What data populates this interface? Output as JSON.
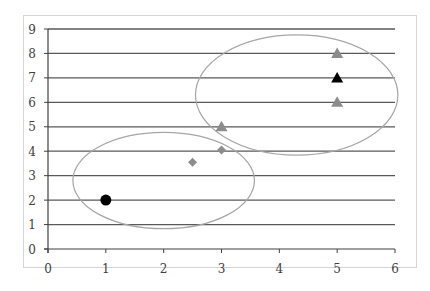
{
  "chart_data": {
    "type": "scatter",
    "title": "",
    "xlabel": "",
    "ylabel": "",
    "xlim": [
      0,
      6
    ],
    "ylim": [
      0,
      9
    ],
    "x_ticks": [
      "0",
      "1",
      "2",
      "3",
      "4",
      "5",
      "6"
    ],
    "y_ticks": [
      "0",
      "1",
      "2",
      "3",
      "4",
      "5",
      "6",
      "7",
      "8",
      "9"
    ],
    "grid": "horizontal",
    "legend": "none",
    "series": [
      {
        "name": "black-circle",
        "marker": "circle",
        "color": "#000000",
        "points": [
          [
            1,
            2
          ]
        ]
      },
      {
        "name": "gray-diamonds",
        "marker": "diamond",
        "color": "#8c8c8c",
        "points": [
          [
            2.5,
            3.55
          ],
          [
            3,
            4.05
          ]
        ]
      },
      {
        "name": "gray-triangles",
        "marker": "triangle",
        "color": "#8c8c8c",
        "points": [
          [
            3,
            5
          ],
          [
            5,
            8
          ],
          [
            5,
            6
          ]
        ]
      },
      {
        "name": "black-triangle",
        "marker": "triangle",
        "color": "#000000",
        "points": [
          [
            5,
            7
          ]
        ]
      }
    ],
    "annotations": [
      {
        "type": "ellipse",
        "name": "lower-cluster",
        "cx": 2.0,
        "cy": 2.8,
        "rx_units": 1.57,
        "ry_units": 1.97,
        "color": "#a6a6a6"
      },
      {
        "type": "ellipse",
        "name": "upper-cluster",
        "cx": 4.3,
        "cy": 6.3,
        "rx_units": 1.75,
        "ry_units": 2.46,
        "color": "#a6a6a6"
      }
    ]
  },
  "colors": {
    "gridline": "#595959",
    "axis": "#404040",
    "frame": "#d4d4d4",
    "ellipse": "#a6a6a6",
    "gray_marker": "#8c8c8c",
    "black_marker": "#000000"
  }
}
